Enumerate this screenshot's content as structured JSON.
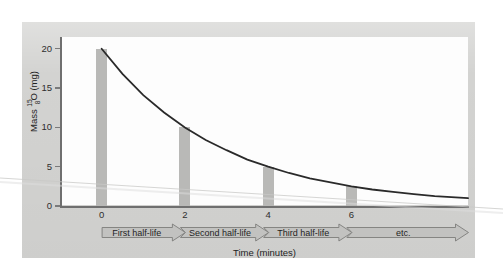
{
  "chart_data": {
    "type": "bar",
    "title": "",
    "xlabel": "Time (minutes)",
    "ylabel": "Mass 15-8 O (mg)",
    "ylabel_parts": {
      "prefix": "Mass ",
      "mass_number": "15",
      "atomic_number": "8",
      "element": "O",
      "units": " (mg)"
    },
    "categories": [
      0,
      2,
      4,
      6
    ],
    "values": [
      20,
      10,
      5,
      2.5
    ],
    "xtick_labels": [
      "0",
      "2",
      "4",
      "6"
    ],
    "ytick_labels": [
      "20",
      "15",
      "10",
      "5",
      "0"
    ],
    "ytick_values": [
      20,
      15,
      10,
      5,
      0
    ],
    "xlim": [
      -1,
      8.8
    ],
    "ylim": [
      0,
      21.5
    ],
    "grid": false,
    "legend": "none",
    "series": [
      {
        "name": "Mass remaining (bars)",
        "type": "bar",
        "values": [
          20,
          10,
          5,
          2.5
        ]
      },
      {
        "name": "Exponential decay curve",
        "type": "line",
        "half_life_minutes": 2,
        "initial_mass_mg": 20,
        "points": [
          [
            0,
            20
          ],
          [
            0.5,
            16.8
          ],
          [
            1,
            14.1
          ],
          [
            1.5,
            11.9
          ],
          [
            2,
            10
          ],
          [
            2.5,
            8.4
          ],
          [
            3,
            7.1
          ],
          [
            3.5,
            5.9
          ],
          [
            4,
            5
          ],
          [
            4.5,
            4.2
          ],
          [
            5,
            3.5
          ],
          [
            5.5,
            3.0
          ],
          [
            6,
            2.5
          ],
          [
            6.5,
            2.1
          ],
          [
            7,
            1.8
          ],
          [
            7.5,
            1.5
          ],
          [
            8,
            1.25
          ],
          [
            8.8,
            1.0
          ]
        ]
      }
    ],
    "annotations": [
      {
        "label": "First half-life",
        "x_start": 0,
        "x_end": 2
      },
      {
        "label": "Second half-life",
        "x_start": 2,
        "x_end": 4
      },
      {
        "label": "Third half-life",
        "x_start": 4,
        "x_end": 6
      },
      {
        "label": "etc.",
        "x_start": 6,
        "x_end": 8.8
      }
    ],
    "colors": {
      "bar": "#b9b9b7",
      "curve": "#2a2a2a",
      "axis": "#6f6f6f",
      "panel_background": "#d3d3d1",
      "plot_background": "#fdfdfd",
      "arrow_fill": "#c2c2c0",
      "arrow_stroke": "#7d7d7b",
      "text": "#232323"
    }
  },
  "axes": {
    "y_title_prefix": "Mass ",
    "y_title_sup": "15",
    "y_title_sub": "8",
    "y_title_element": "O",
    "y_title_units": " (mg)",
    "x_title": "Time (minutes)",
    "yticks": [
      "20",
      "15",
      "10",
      "5",
      "0"
    ],
    "xticks": [
      "0",
      "2",
      "4",
      "6"
    ]
  },
  "arrows": [
    {
      "label": "First half-life"
    },
    {
      "label": "Second half-life"
    },
    {
      "label": "Third half-life"
    },
    {
      "label": "etc."
    }
  ]
}
